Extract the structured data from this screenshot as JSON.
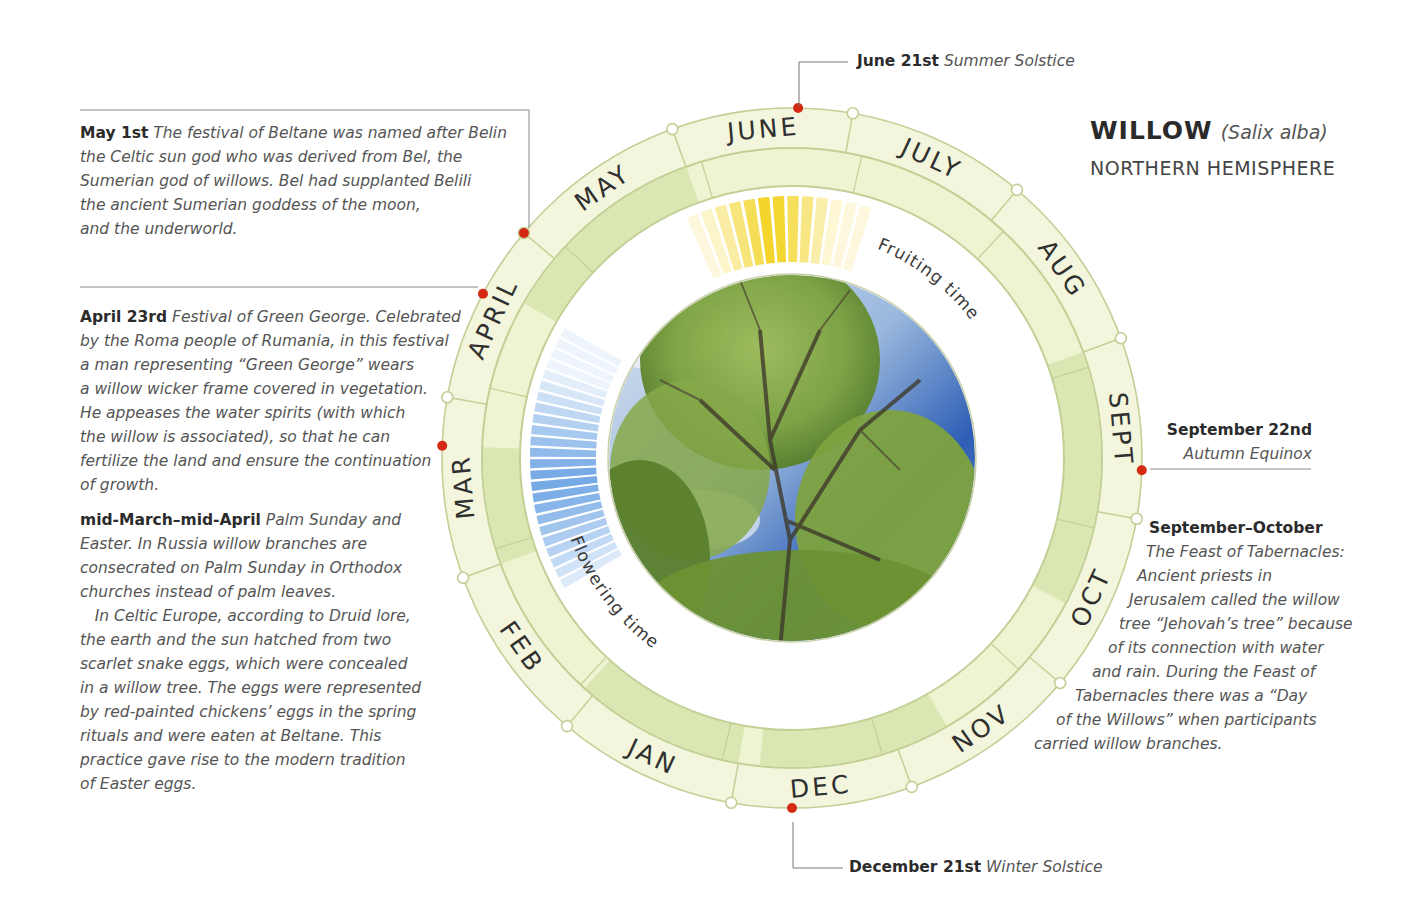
{
  "title": {
    "name": "WILLOW",
    "latin": "(Salix alba)",
    "subtitle": "NORTHERN HEMISPHERE"
  },
  "wheel": {
    "center": [
      792,
      458
    ],
    "radii": {
      "outer": 350,
      "month_inner": 310,
      "band_inner": 272,
      "white_inner": 190,
      "photo": 183
    },
    "colors": {
      "ring": "#f3f6dc",
      "band": "#eef3d2",
      "band_dark": "#dbe7b2",
      "line": "#c2d096",
      "event_dot": "#d42a14",
      "boundary_dot_fill": "#ffffff",
      "fruiting": "#f2d21c",
      "flowering": "#7eb0e6",
      "text": "#2f2f2f"
    },
    "months": [
      {
        "label": "JUNE",
        "center_angle": 355
      },
      {
        "label": "JULY",
        "center_angle": 25
      },
      {
        "label": "AUG",
        "center_angle": 55
      },
      {
        "label": "SEPT",
        "center_angle": 85
      },
      {
        "label": "OCT",
        "center_angle": 115
      },
      {
        "label": "NOV",
        "center_angle": 145
      },
      {
        "label": "DEC",
        "center_angle": 175
      },
      {
        "label": "JAN",
        "center_angle": 205
      },
      {
        "label": "FEB",
        "center_angle": 235
      },
      {
        "label": "MAR",
        "center_angle": 265
      },
      {
        "label": "APRIL",
        "center_angle": 295
      },
      {
        "label": "MAY",
        "center_angle": 325
      }
    ],
    "dark_band_arcs": [
      [
        300,
        340
      ],
      [
        70,
        100
      ],
      [
        250,
        272
      ],
      [
        100,
        118
      ],
      [
        150,
        186
      ],
      [
        190,
        222
      ]
    ],
    "event_dots_angles": [
      1,
      92,
      180,
      272,
      298,
      310
    ],
    "fruiting": {
      "label": "Fruiting time",
      "start_angle": 336,
      "end_angle": 18,
      "segments": 13
    },
    "flowering": {
      "label": "Flowering time",
      "start_angle": 240,
      "end_angle": 300,
      "segments": 24
    }
  },
  "callouts": {
    "june": {
      "lead": "June 21st",
      "body": "Summer Solstice"
    },
    "december": {
      "lead": "December 21st",
      "body": "Winter Solstice"
    },
    "september": {
      "lead": "September 22nd",
      "body": "Autumn Equinox"
    }
  },
  "notes": {
    "may": {
      "lead": "May 1st",
      "lines": [
        "The festival of Beltane was named after Belin",
        "the Celtic sun god who was derived from Bel, the",
        "Sumerian god of willows. Bel had supplanted Belili",
        "the ancient Sumerian goddess of the moon,",
        "and the underworld."
      ]
    },
    "april": {
      "lead": "April 23rd",
      "lines": [
        "Festival of Green George. Celebrated",
        "by the Roma people of Rumania, in this festival",
        "a man representing “Green George” wears",
        "a willow wicker frame covered in vegetation.",
        "He appeases the water spirits (with which",
        "the willow is associated), so that he can",
        "fertilize the land and ensure the continuation",
        "of growth."
      ]
    },
    "march": {
      "lead": "mid-March–mid-April",
      "lines": [
        "Palm Sunday and",
        "Easter. In Russia willow branches are",
        "consecrated on Palm Sunday in Orthodox",
        "churches instead of palm leaves.",
        "   In Celtic Europe, according to Druid lore,",
        "the earth and the sun hatched from two",
        "scarlet snake eggs, which were concealed",
        "in a willow tree. The eggs were represented",
        "by red-painted chickens’ eggs in the spring",
        "rituals and were eaten at Beltane. This",
        "practice gave rise to the modern tradition",
        "of Easter eggs."
      ]
    },
    "tabernacles": {
      "lead": "September–October",
      "lines": [
        {
          "text": "The Feast of Tabernacles:",
          "indent": 116
        },
        {
          "text": "Ancient priests in",
          "indent": 107
        },
        {
          "text": "Jerusalem called the willow",
          "indent": 99
        },
        {
          "text": "tree “Jehovah’s tree” because",
          "indent": 89
        },
        {
          "text": "of its connection with water",
          "indent": 78
        },
        {
          "text": "and rain. During the Feast of",
          "indent": 62
        },
        {
          "text": "Tabernacles there was a “Day",
          "indent": 45
        },
        {
          "text": "of the Willows” when participants",
          "indent": 26
        },
        {
          "text": "carried willow branches.",
          "indent": 4
        }
      ]
    }
  }
}
